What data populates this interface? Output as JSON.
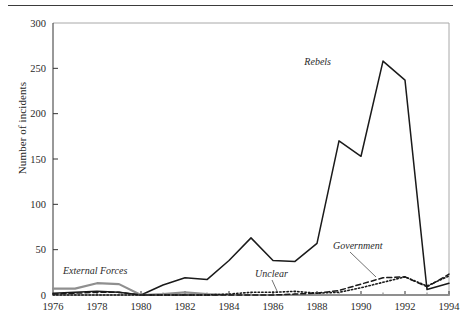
{
  "figure": {
    "has_top_rule": true,
    "background": "#ffffff"
  },
  "axis": {
    "y_label": "Number of incidents",
    "y_ticks": [
      "0",
      "50",
      "100",
      "150",
      "200",
      "250",
      "300"
    ],
    "x_ticks": [
      "1976",
      "1978",
      "1980",
      "1982",
      "1984",
      "1986",
      "1988",
      "1990",
      "1992",
      "1994"
    ]
  },
  "annotations": {
    "external_forces": "External Forces",
    "unclear": "Unclear",
    "government": "Government",
    "rebels": "Rebels"
  },
  "chart_data": {
    "type": "line",
    "title": "",
    "xlabel": "",
    "ylabel": "Number of incidents",
    "xlim": [
      1976,
      1994
    ],
    "ylim": [
      0,
      300
    ],
    "grid": false,
    "legend": "inline-annotations",
    "x": [
      1976,
      1977,
      1978,
      1979,
      1980,
      1981,
      1982,
      1983,
      1984,
      1985,
      1986,
      1987,
      1988,
      1989,
      1990,
      1991,
      1992,
      1993,
      1994
    ],
    "series": [
      {
        "name": "Rebels",
        "style": "solid",
        "color": "#1a1a1a",
        "values": [
          2,
          3,
          4,
          3,
          0,
          11,
          19,
          17,
          38,
          63,
          38,
          37,
          57,
          170,
          153,
          258,
          237,
          6,
          13
        ]
      },
      {
        "name": "External Forces",
        "style": "solid-gray",
        "color": "#8f8f8f",
        "values": [
          7,
          7,
          13,
          12,
          0,
          1,
          3,
          1,
          0,
          0,
          0,
          0,
          0,
          0,
          0,
          0,
          0,
          0,
          0
        ]
      },
      {
        "name": "Government",
        "style": "dashed",
        "color": "#1a1a1a",
        "values": [
          1,
          2,
          3,
          3,
          0,
          0,
          0,
          0,
          0,
          0,
          0,
          1,
          2,
          5,
          12,
          19,
          20,
          9,
          23
        ]
      },
      {
        "name": "Unclear",
        "style": "dotted",
        "color": "#1a1a1a",
        "values": [
          0,
          0,
          0,
          0,
          0,
          0,
          0,
          0,
          1,
          3,
          3,
          4,
          2,
          3,
          8,
          14,
          20,
          10,
          21
        ]
      }
    ]
  }
}
